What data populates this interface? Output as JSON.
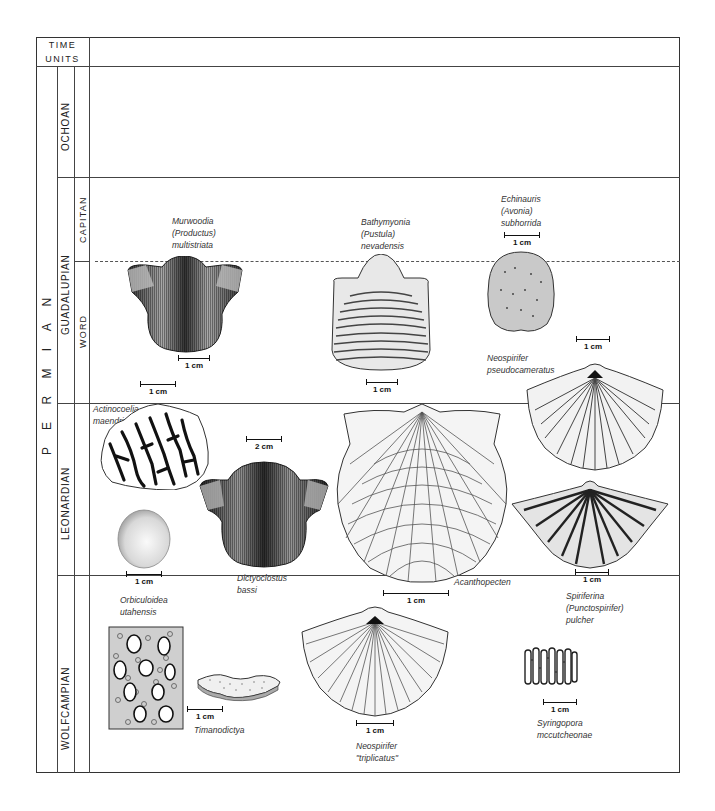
{
  "header": {
    "line1": "TIME",
    "line2": "UNITS"
  },
  "period": {
    "label": "P E R M I A N"
  },
  "series": [
    {
      "name": "OCHOAN"
    },
    {
      "name": "GUADALUPIAN",
      "stages": [
        {
          "name": "CAPITAN"
        },
        {
          "name": "WORD"
        }
      ]
    },
    {
      "name": "LEONARDIAN"
    },
    {
      "name": "WOLFCAMPIAN"
    }
  ],
  "fossils": [
    {
      "id": "murwoodia",
      "name_lines": [
        "Murwoodia",
        "(Productus)",
        "multistriata"
      ],
      "scale": "1 cm"
    },
    {
      "id": "bathymyonia",
      "name_lines": [
        "Bathymyonia",
        "(Pustula)",
        "nevadensis"
      ],
      "scale": "1 cm"
    },
    {
      "id": "echinauris",
      "name_lines": [
        "Echinauris",
        "(Avonia)",
        "subhorrida"
      ],
      "scale": "1 cm"
    },
    {
      "id": "neospirifer-pseudo",
      "name_lines": [
        "Neospirifer",
        "pseudocameratus"
      ],
      "scale": "1 cm"
    },
    {
      "id": "actinocoelia",
      "name_lines": [
        "Actinocoelia",
        "maendrina"
      ],
      "scale": "1 cm"
    },
    {
      "id": "dictyoclostus",
      "name_lines": [
        "Dictyoclostus",
        "bassi"
      ],
      "scale": "2 cm"
    },
    {
      "id": "acanthopecten",
      "name_lines": [
        "Acanthopecten"
      ],
      "scale": "1 cm"
    },
    {
      "id": "orbiculoidea",
      "name_lines": [
        "Orbiculoidea",
        "utahensis"
      ],
      "scale": "1 cm"
    },
    {
      "id": "spiriferina",
      "name_lines": [
        "Spiriferina",
        "(Punctospirifer)",
        "pulcher"
      ],
      "scale": "1 cm"
    },
    {
      "id": "timanodictya",
      "name_lines": [
        "Timanodictya"
      ],
      "scale": "1 cm"
    },
    {
      "id": "neospirifer-trip",
      "name_lines": [
        "Neospirifer",
        "\"triplicatus\""
      ],
      "scale": "1 cm"
    },
    {
      "id": "syringopora",
      "name_lines": [
        "Syringopora",
        "mccutcheonae"
      ],
      "scale": "1 cm"
    }
  ]
}
